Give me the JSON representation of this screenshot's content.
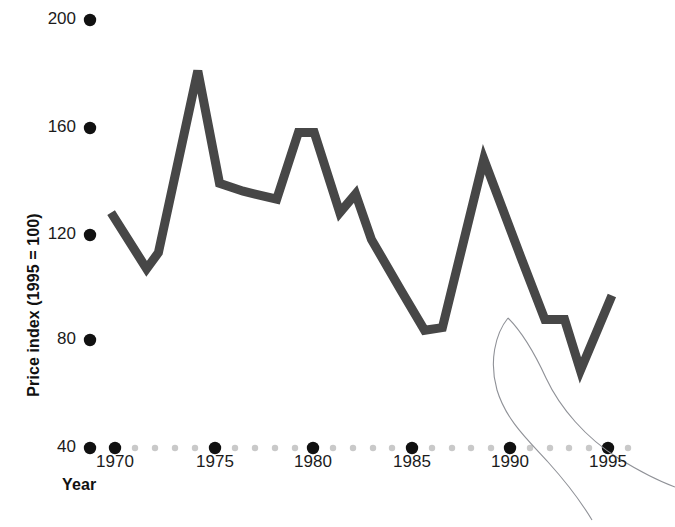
{
  "chart_data": {
    "type": "line",
    "title": "",
    "subtitle": "",
    "xlabel": "Year",
    "ylabel": "Price index (1995 = 100)",
    "xlim": [
      1968,
      1996
    ],
    "ylim": [
      40,
      200
    ],
    "xticks": [
      1970,
      1975,
      1980,
      1985,
      1990,
      1995
    ],
    "xtick_labels": [
      "1970",
      "1975",
      "1980",
      "1985",
      "1990",
      "1995"
    ],
    "yticks": [
      40,
      80,
      120,
      160,
      200
    ],
    "ytick_labels": [
      "40",
      "80",
      "120",
      "160",
      "200"
    ],
    "minor_xtick_interval": 1,
    "grid": false,
    "legend": null,
    "tick_style": "dots",
    "series": [
      {
        "name": "Price index",
        "color": "#474747",
        "line_width": 9,
        "x": [
          1969.8,
          1971.6,
          1972.2,
          1974.2,
          1975.3,
          1976.5,
          1978.2,
          1979.3,
          1980.1,
          1981.4,
          1982.2,
          1983.0,
          1984.5,
          1985.7,
          1986.6,
          1988.7,
          1990.6,
          1991.8,
          1992.8,
          1993.6,
          1995.2
        ],
        "y": [
          128,
          107,
          113,
          181,
          139,
          136,
          133,
          158,
          158,
          128,
          135,
          118,
          99,
          84,
          85,
          148,
          111,
          88,
          88,
          69,
          97
        ],
        "values_note": "index points, 1995 = 100"
      },
      {
        "name": "scan-artifact-hair",
        "color": "#8f9197",
        "line_width": 1,
        "kind": "artifact"
      }
    ],
    "data_points": [
      {
        "year": 1970,
        "value": 128
      },
      {
        "year": 1972,
        "value": 107
      },
      {
        "year": 1973,
        "value": 113
      },
      {
        "year": 1974,
        "value": 181
      },
      {
        "year": 1975,
        "value": 139
      },
      {
        "year": 1977,
        "value": 136
      },
      {
        "year": 1978,
        "value": 133
      },
      {
        "year": 1979,
        "value": 158
      },
      {
        "year": 1980,
        "value": 158
      },
      {
        "year": 1981,
        "value": 128
      },
      {
        "year": 1982,
        "value": 135
      },
      {
        "year": 1983,
        "value": 118
      },
      {
        "year": 1985,
        "value": 99
      },
      {
        "year": 1986,
        "value": 84
      },
      {
        "year": 1987,
        "value": 85
      },
      {
        "year": 1989,
        "value": 148
      },
      {
        "year": 1991,
        "value": 111
      },
      {
        "year": 1992,
        "value": 88
      },
      {
        "year": 1993,
        "value": 88
      },
      {
        "year": 1994,
        "value": 69
      },
      {
        "year": 1995,
        "value": 97
      }
    ]
  },
  "axes": {
    "y_title": "Price index (1995 = 100)",
    "x_title": "Year",
    "y_labels": [
      "200",
      "160",
      "120",
      "80",
      "40"
    ],
    "x_labels": [
      "1970",
      "1975",
      "1980",
      "1985",
      "1990",
      "1995"
    ]
  },
  "colors": {
    "series_line": "#474747",
    "tick_dot_major": "#111111",
    "tick_dot_minor": "#c9c9c9",
    "text": "#1a1a1a",
    "background": "#ffffff",
    "artifact": "#8f9197"
  }
}
